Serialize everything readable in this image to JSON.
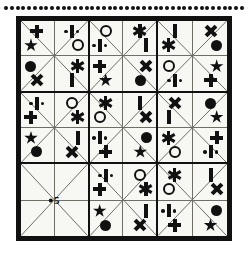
{
  "puzzle": {
    "title": "Symbol Sudoku Grid",
    "decoration": {
      "top_dot_count": 42,
      "dot_color": "#111111"
    },
    "frame": {
      "border_color": "#111111",
      "fill_color": "#f7f7f4"
    },
    "grid": {
      "blocks_across": 3,
      "blocks_down": 3,
      "cells_per_block": 4,
      "slots_per_block": 8
    },
    "symbol_legend": [
      {
        "key": "plus",
        "name": "plus-symbol"
      },
      {
        "key": "dbar",
        "name": "dotted-bar-symbol"
      },
      {
        "key": "ocircle",
        "name": "open-circle-symbol"
      },
      {
        "key": "fcircle",
        "name": "filled-circle-symbol"
      },
      {
        "key": "bar",
        "name": "vertical-bar-symbol"
      },
      {
        "key": "ex",
        "name": "cross-x-symbol"
      },
      {
        "key": "ast",
        "name": "asterisk-symbol"
      },
      {
        "key": "star",
        "name": "star-symbol"
      }
    ],
    "blocks": [
      {
        "id": "block-r1c1",
        "row": 1,
        "col": 1,
        "center_mark": null,
        "slots": {
          "tl_top": "plus",
          "tl_left": "star",
          "tr_top": "dbar",
          "tr_right": "ocircle",
          "bl_left": "fcircle",
          "bl_bottom": "ex",
          "br_right": "ast",
          "br_bottom": "bar"
        }
      },
      {
        "id": "block-r1c2",
        "row": 1,
        "col": 2,
        "center_mark": null,
        "slots": {
          "tl_top": "ocircle",
          "tl_left": "dbar",
          "tr_top": "ast",
          "tr_right": "bar",
          "bl_left": "plus",
          "bl_bottom": "star",
          "br_right": "ex",
          "br_bottom": "fcircle"
        }
      },
      {
        "id": "block-r1c3",
        "row": 1,
        "col": 3,
        "center_mark": null,
        "slots": {
          "tl_top": "bar",
          "tl_left": "ast",
          "tr_top": "ex",
          "tr_right": "fcircle",
          "bl_left": "ocircle",
          "bl_bottom": "dbar",
          "br_right": "star",
          "br_bottom": "plus"
        }
      },
      {
        "id": "block-r2c1",
        "row": 2,
        "col": 1,
        "center_mark": null,
        "slots": {
          "tl_top": "dbar",
          "tl_left": "plus",
          "tr_top": "ocircle",
          "tr_right": "ast",
          "bl_left": "star",
          "bl_bottom": "fcircle",
          "br_right": "bar",
          "br_bottom": "ex"
        }
      },
      {
        "id": "block-r2c2",
        "row": 2,
        "col": 2,
        "center_mark": null,
        "slots": {
          "tl_top": "ast",
          "tl_left": "ocircle",
          "tr_top": "bar",
          "tr_right": "ex",
          "bl_left": "dbar",
          "bl_bottom": "plus",
          "br_right": "fcircle",
          "br_bottom": "star"
        }
      },
      {
        "id": "block-r2c3",
        "row": 2,
        "col": 3,
        "center_mark": null,
        "slots": {
          "tl_top": "ex",
          "tl_left": "bar",
          "tr_top": "fcircle",
          "tr_right": "star",
          "bl_left": "ast",
          "bl_bottom": "ocircle",
          "br_right": "plus",
          "br_bottom": "dbar"
        }
      },
      {
        "id": "block-r3c1",
        "row": 3,
        "col": 1,
        "center_mark": "5",
        "slots": {
          "tl_top": null,
          "tl_left": null,
          "tr_top": null,
          "tr_right": null,
          "bl_left": null,
          "bl_bottom": null,
          "br_right": null,
          "br_bottom": null
        }
      },
      {
        "id": "block-r3c2",
        "row": 3,
        "col": 2,
        "center_mark": null,
        "slots": {
          "tl_top": "dbar",
          "tl_left": "plus",
          "tr_top": "ocircle",
          "tr_right": "ast",
          "bl_left": "star",
          "bl_bottom": "fcircle",
          "br_right": "bar",
          "br_bottom": "ex"
        }
      },
      {
        "id": "block-r3c3",
        "row": 3,
        "col": 3,
        "center_mark": null,
        "slots": {
          "tl_top": "ast",
          "tl_left": "ocircle",
          "tr_top": "bar",
          "tr_right": "ex",
          "bl_left": "dbar",
          "bl_bottom": "plus",
          "br_right": "fcircle",
          "br_bottom": "star"
        }
      }
    ]
  }
}
